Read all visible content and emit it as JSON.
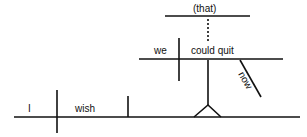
{
  "diagram": {
    "type": "sentence-diagram",
    "sentence": "I wish we could quit now",
    "main_clause": {
      "subject": "I",
      "verb": "wish"
    },
    "noun_clause": {
      "connector": "(that)",
      "subject": "we",
      "verb": "could quit",
      "modifier": "now"
    },
    "colors": {
      "line": "#111111",
      "background": "#ffffff"
    }
  }
}
